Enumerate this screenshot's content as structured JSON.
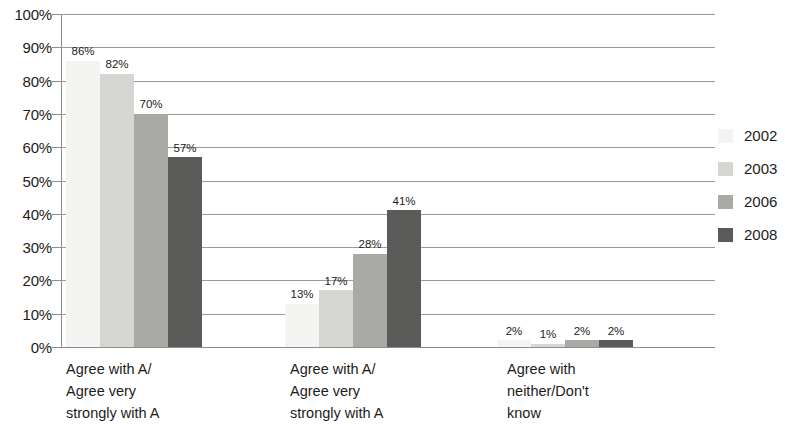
{
  "chart_data": {
    "type": "bar",
    "title": "",
    "subtitle": "",
    "xlabel": "",
    "ylabel": "",
    "ylim": [
      0,
      100
    ],
    "y_tick_labels": [
      "100%",
      "90%",
      "80%",
      "70%",
      "60%",
      "50%",
      "40%",
      "30%",
      "20%",
      "10%",
      "0%"
    ],
    "y_tick_values": [
      100,
      90,
      80,
      70,
      60,
      50,
      40,
      30,
      20,
      10,
      0
    ],
    "grid": true,
    "legend_position": "right",
    "categories": [
      "Agree with A/\nAgree very\nstrongly with A",
      "Agree with A/\nAgree very\nstrongly with A",
      "Agree with\nneither/Don't\nknow"
    ],
    "series": [
      {
        "name": "2002",
        "color": "#f4f4f2",
        "values": [
          86,
          13,
          2
        ],
        "labels": [
          "86%",
          "13%",
          "2%"
        ]
      },
      {
        "name": "2003",
        "color": "#d6d6d3",
        "values": [
          82,
          17,
          1
        ],
        "labels": [
          "82%",
          "17%",
          "1%"
        ]
      },
      {
        "name": "2006",
        "color": "#a9a9a6",
        "values": [
          70,
          28,
          2
        ],
        "labels": [
          "70%",
          "28%",
          "2%"
        ]
      },
      {
        "name": "2008",
        "color": "#5a5a58",
        "values": [
          57,
          41,
          2
        ],
        "labels": [
          "57%",
          "41%",
          "2%"
        ]
      }
    ]
  },
  "legend": {
    "items": [
      {
        "label": "2002"
      },
      {
        "label": "2003"
      },
      {
        "label": "2006"
      },
      {
        "label": "2008"
      }
    ]
  }
}
